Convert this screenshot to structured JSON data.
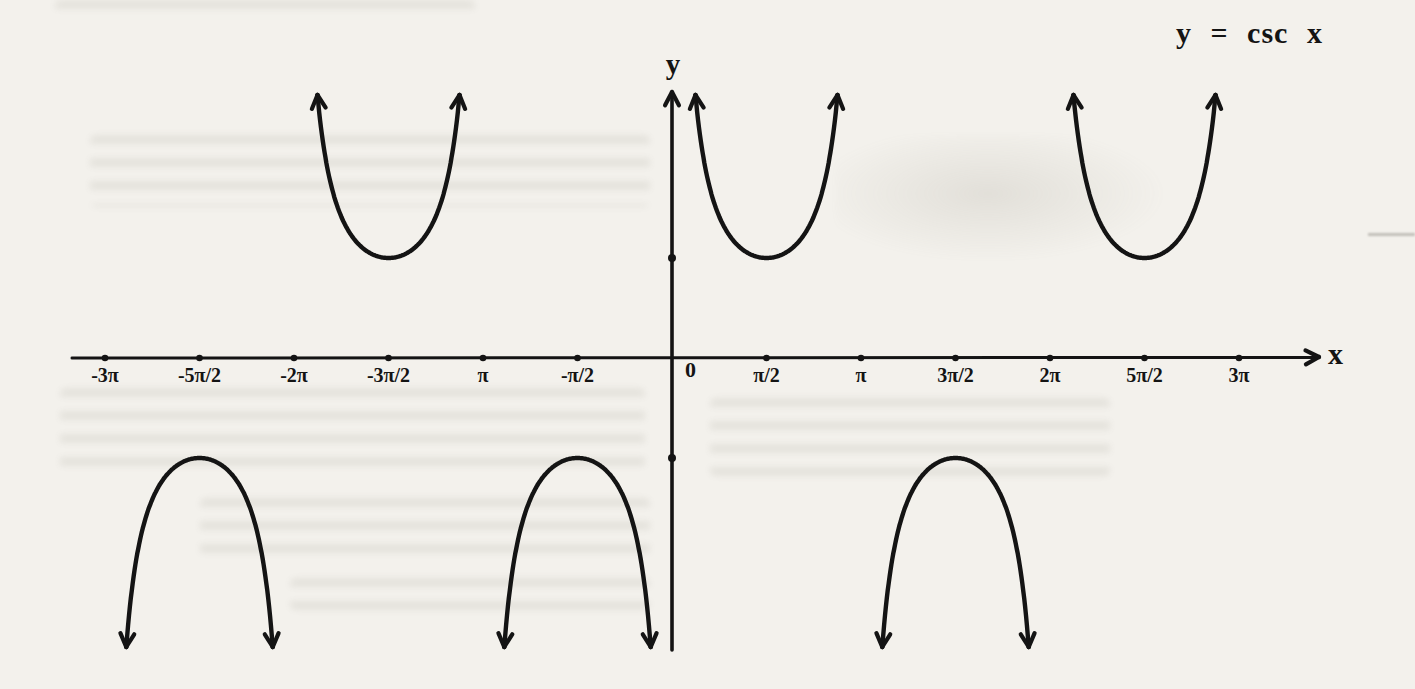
{
  "page": {
    "background": "#f3f1ec",
    "ink": "#141414"
  },
  "title": "y = csc x",
  "axes": {
    "x_label": "x",
    "y_label": "y",
    "origin_label": "0"
  },
  "chart_data": {
    "type": "line",
    "title": "y = csc x",
    "function": "y = csc(x) = 1/sin(x)",
    "xlabel": "x",
    "ylabel": "y",
    "grid": false,
    "legend": false,
    "xlim_over_pi": [
      -3.2,
      3.4
    ],
    "ylim": [
      -2.9,
      2.65
    ],
    "period": "2π",
    "x_ticks": [
      {
        "label": "-3π",
        "value_over_pi": -3
      },
      {
        "label": "-5π/2",
        "value_over_pi": -2.5
      },
      {
        "label": "-2π",
        "value_over_pi": -2
      },
      {
        "label": "-3π/2",
        "value_over_pi": -1.5
      },
      {
        "label": "π",
        "value_over_pi": -1
      },
      {
        "label": "-π/2",
        "value_over_pi": -0.5
      },
      {
        "label": "π/2",
        "value_over_pi": 0.5
      },
      {
        "label": "π",
        "value_over_pi": 1
      },
      {
        "label": "3π/2",
        "value_over_pi": 1.5
      },
      {
        "label": "2π",
        "value_over_pi": 2
      },
      {
        "label": "5π/2",
        "value_over_pi": 2.5
      },
      {
        "label": "3π",
        "value_over_pi": 3
      }
    ],
    "origin_label": "0",
    "y_axis_dots": [
      1,
      -1
    ],
    "asymptotes_over_pi": [
      -3,
      -2,
      -1,
      0,
      1,
      2,
      3
    ],
    "branches": [
      {
        "center_over_pi": -2.5,
        "direction": "down",
        "extremum": -1
      },
      {
        "center_over_pi": -1.5,
        "direction": "up",
        "extremum": 1
      },
      {
        "center_over_pi": -0.5,
        "direction": "down",
        "extremum": -1
      },
      {
        "center_over_pi": 0.5,
        "direction": "up",
        "extremum": 1
      },
      {
        "center_over_pi": 1.5,
        "direction": "down",
        "extremum": -1
      },
      {
        "center_over_pi": 2.5,
        "direction": "up",
        "extremum": 1
      }
    ]
  }
}
